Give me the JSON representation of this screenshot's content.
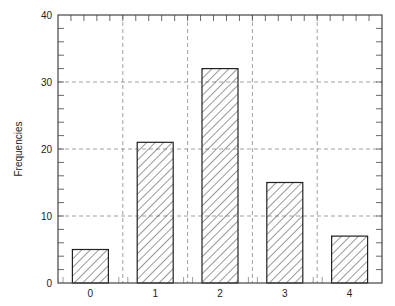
{
  "chart_data": {
    "type": "bar",
    "title": "",
    "xlabel": "",
    "ylabel": "Frequencies",
    "categories": [
      "0",
      "1",
      "2",
      "3",
      "4"
    ],
    "values": [
      5,
      21,
      32,
      15,
      7
    ],
    "ylim": [
      0,
      40
    ],
    "yticks": [
      0,
      10,
      20,
      30,
      40
    ],
    "grid": true,
    "grid_style": "dashed",
    "legend": null,
    "bar_fill": "diagonal-hatch",
    "colors": {
      "bar_edge": "#222222",
      "hatch": "#333333",
      "grid": "#888888",
      "axis": "#444444"
    }
  }
}
